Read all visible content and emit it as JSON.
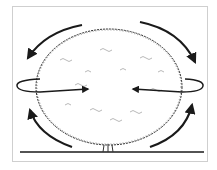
{
  "figure": {
    "subject": "shrub-pruning-diagram",
    "elements": {
      "shrub": "rounded-shrub-canopy",
      "ground": "ground-line",
      "arrows": [
        {
          "name": "top-left-arc-arrow",
          "direction": "down-left"
        },
        {
          "name": "top-right-arc-arrow",
          "direction": "down-right"
        },
        {
          "name": "bottom-left-arc-arrow",
          "direction": "up"
        },
        {
          "name": "bottom-right-arc-arrow",
          "direction": "up"
        },
        {
          "name": "left-loop-arrow",
          "direction": "inward-right"
        },
        {
          "name": "right-loop-arrow",
          "direction": "inward-left"
        }
      ]
    },
    "colors": {
      "line": "#1a1a1a",
      "foliage": "#6a6a6a",
      "frame": "#cfcfcf",
      "background": "#ffffff"
    }
  }
}
